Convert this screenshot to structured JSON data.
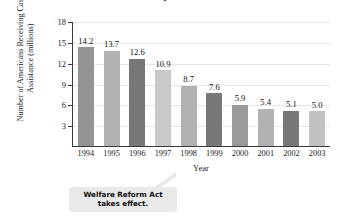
{
  "chart_data": {
    "type": "bar",
    "title": "Welfare Recipients in the U.S.",
    "xlabel": "Year",
    "ylabel": "Number of Americans Receiving Cash Assistance (millions)",
    "categories": [
      "1994",
      "1995",
      "1996",
      "1997",
      "1998",
      "1999",
      "2000",
      "2001",
      "2002",
      "2003"
    ],
    "values": [
      14.2,
      13.7,
      12.6,
      10.9,
      8.7,
      7.6,
      5.9,
      5.4,
      5.1,
      5.0
    ],
    "value_labels": [
      "14.2",
      "13.7",
      "12.6",
      "10.9",
      "8.7",
      "7.6",
      "5.9",
      "5.4",
      "5.1",
      "5.0"
    ],
    "bar_colors": [
      "#949494",
      "#b2b2b2",
      "#777777",
      "#c9c9c9",
      "#b2b2b2",
      "#777777",
      "#9a9a9a",
      "#b2b2b2",
      "#777777",
      "#c2c2c2"
    ],
    "ylim": [
      0,
      18
    ],
    "yticks": [
      3,
      6,
      9,
      12,
      15,
      18
    ],
    "ytick_labels": [
      "3",
      "6",
      "9",
      "12",
      "15",
      "18"
    ],
    "grid": true,
    "legend": null,
    "annotations": [
      {
        "text_line1": "Welfare Reform Act",
        "text_line2": "takes effect.",
        "points_to": "1997"
      }
    ]
  }
}
